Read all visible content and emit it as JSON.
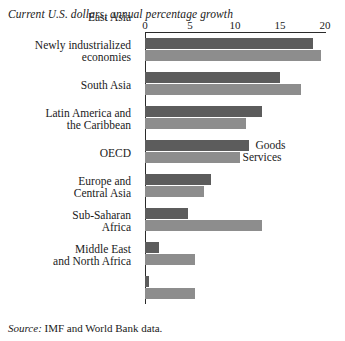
{
  "subtitle": "Current U.S. dollars, annual percentage growth",
  "source": {
    "label": "Source:",
    "text": "IMF and World Bank data."
  },
  "legend": {
    "goods": "Goods",
    "services": "Services",
    "goods_color": "#5c5c5c",
    "services_color": "#8d8d8d"
  },
  "chart_data": {
    "type": "bar",
    "orientation": "horizontal",
    "title": "",
    "subtitle": "Current U.S. dollars, annual percentage growth",
    "xlabel": "",
    "ylabel": "",
    "xlim": [
      0,
      20
    ],
    "xticks": [
      0,
      5,
      10,
      15,
      20
    ],
    "xticklabels": [
      "0",
      "5",
      "10",
      "15",
      "20"
    ],
    "grid": false,
    "legend_position": "inside-right",
    "categories": [
      "East Asia",
      "Newly industrialized economies",
      "South Asia",
      "Latin America and the Caribbean",
      "OECD",
      "Europe and Central Asia",
      "Sub-Saharan Africa",
      "Middle East and North Africa"
    ],
    "category_lines": [
      [
        "East Asia"
      ],
      [
        "Newly industrialized",
        "economies"
      ],
      [
        "South Asia"
      ],
      [
        "Latin America and",
        "the Caribbean"
      ],
      [
        "OECD"
      ],
      [
        "Europe and",
        "Central Asia"
      ],
      [
        "Sub-Saharan",
        "Africa"
      ],
      [
        "Middle East",
        "and North Africa"
      ]
    ],
    "series": [
      {
        "name": "Goods",
        "color": "#5c5c5c",
        "values": [
          18.7,
          15.0,
          13.0,
          11.6,
          7.3,
          4.8,
          1.6,
          0.4
        ]
      },
      {
        "name": "Services",
        "color": "#8d8d8d",
        "values": [
          19.6,
          17.3,
          11.2,
          10.5,
          6.6,
          13.0,
          5.6,
          5.6
        ]
      }
    ]
  }
}
